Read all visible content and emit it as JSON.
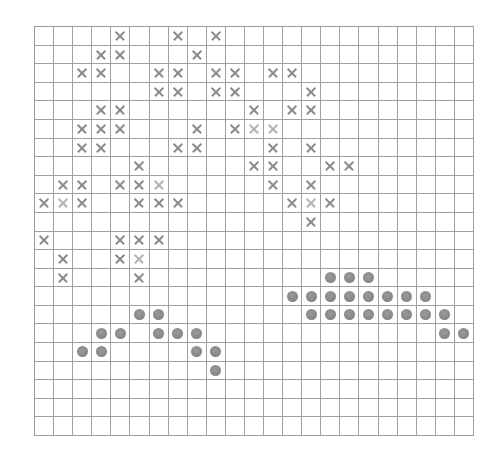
{
  "board": {
    "cols": 23,
    "rows": 22,
    "colors": {
      "grid_line": "#a0a0a0",
      "x_mark": "#8c8c8c",
      "x_mark_faint": "#b4b4b4",
      "dot": "#858585",
      "background": "#ffffff"
    },
    "x_marks": [
      {
        "row": 0,
        "cols": [
          4,
          7,
          9
        ]
      },
      {
        "row": 1,
        "cols": [
          3,
          4,
          8
        ]
      },
      {
        "row": 2,
        "cols": [
          2,
          3,
          6,
          7,
          9,
          10,
          12,
          13
        ]
      },
      {
        "row": 3,
        "cols": [
          6,
          7,
          9,
          10,
          14
        ]
      },
      {
        "row": 4,
        "cols": [
          3,
          4,
          11,
          13,
          14
        ]
      },
      {
        "row": 5,
        "cols": [
          2,
          3,
          4,
          8,
          10,
          11,
          12
        ]
      },
      {
        "row": 6,
        "cols": [
          2,
          3,
          7,
          8,
          12,
          14
        ]
      },
      {
        "row": 7,
        "cols": [
          5,
          11,
          12,
          15,
          16
        ]
      },
      {
        "row": 8,
        "cols": [
          1,
          2,
          4,
          5,
          6,
          12,
          14
        ]
      },
      {
        "row": 9,
        "cols": [
          0,
          1,
          2,
          5,
          6,
          7,
          13,
          14,
          15
        ]
      },
      {
        "row": 10,
        "cols": [
          14
        ]
      },
      {
        "row": 11,
        "cols": [
          0,
          4,
          5,
          6
        ]
      },
      {
        "row": 12,
        "cols": [
          1,
          4,
          5
        ]
      },
      {
        "row": 13,
        "cols": [
          1,
          5
        ]
      }
    ],
    "faint_x_marks": [
      {
        "row": 5,
        "col": 12
      },
      {
        "row": 8,
        "col": 6
      },
      {
        "row": 9,
        "col": 1
      },
      {
        "row": 9,
        "col": 14
      },
      {
        "row": 12,
        "col": 5
      },
      {
        "row": 5,
        "col": 11
      }
    ],
    "dots": [
      {
        "row": 13,
        "cols": [
          15,
          16,
          17
        ]
      },
      {
        "row": 14,
        "cols": [
          13,
          14,
          15,
          16,
          17,
          18,
          19,
          20
        ]
      },
      {
        "row": 15,
        "cols": [
          5,
          6,
          14,
          15,
          16,
          17,
          18,
          19,
          20,
          21
        ]
      },
      {
        "row": 16,
        "cols": [
          3,
          4,
          6,
          7,
          8,
          21,
          22
        ]
      },
      {
        "row": 17,
        "cols": [
          2,
          3,
          8,
          9
        ]
      },
      {
        "row": 18,
        "cols": [
          9
        ]
      }
    ]
  }
}
